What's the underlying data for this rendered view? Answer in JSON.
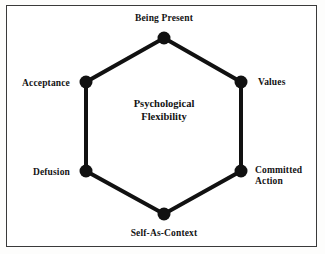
{
  "figure": {
    "center_label": "Psychological\nFlexibility",
    "frame": {
      "border_color": "#3a3a3a",
      "background_color": "#ffffff"
    },
    "hexagon": {
      "stroke_color": "#111111",
      "stroke_width": 4,
      "node_color": "#111111",
      "node_radius": 6.5
    },
    "nodes": [
      {
        "id": "being-present",
        "label": "Being Present",
        "x": 164,
        "y": 38,
        "label_x": 164,
        "label_y": 17,
        "anchor": "center-below"
      },
      {
        "id": "values",
        "label": "Values",
        "x": 241,
        "y": 82,
        "label_x": 258,
        "label_y": 80,
        "anchor": "left"
      },
      {
        "id": "committed-action",
        "label": "Committed\nAction",
        "x": 241,
        "y": 171,
        "label_x": 256,
        "label_y": 176,
        "anchor": "left"
      },
      {
        "id": "self-as-context",
        "label": "Self-As-Context",
        "x": 164,
        "y": 214,
        "label_x": 164,
        "label_y": 229,
        "anchor": "center-above"
      },
      {
        "id": "defusion",
        "label": "Defusion",
        "x": 86,
        "y": 171,
        "label_x": 69,
        "label_y": 171,
        "anchor": "right"
      },
      {
        "id": "acceptance",
        "label": "Acceptance",
        "x": 86,
        "y": 82,
        "label_x": 69,
        "label_y": 80,
        "anchor": "right"
      }
    ]
  },
  "chart_data": {
    "type": "diagram",
    "title": "Psychological Flexibility",
    "shape": "hexagon",
    "categories": [
      "Being Present",
      "Values",
      "Committed Action",
      "Self-As-Context",
      "Defusion",
      "Acceptance"
    ],
    "center": "Psychological Flexibility",
    "legend": "none",
    "grid": false
  }
}
